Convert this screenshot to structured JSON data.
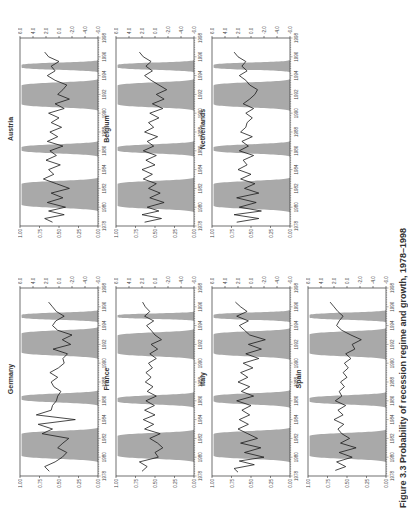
{
  "figure": {
    "rotation_deg": -90,
    "caption": "Figure 3.3 Probability of recession regime and growth, 1978–1998",
    "left_axis_ticks": [
      "1.00",
      "0.75",
      "0.50",
      "0.25",
      "0.00"
    ],
    "right_axis_ticks": [
      "6.0",
      "4.0",
      "2.0",
      "0.0",
      "-2.0",
      "-4.0",
      "-6.0"
    ],
    "x_ticks": [
      "1978",
      "1980",
      "1982",
      "1984",
      "1986",
      "1988",
      "1990",
      "1992",
      "1994",
      "1996",
      "1998"
    ],
    "colors": {
      "shade": "#a9a9a9",
      "line": "#1a1a1a",
      "axis": "#333333"
    }
  },
  "chart_data": [
    {
      "type": "area+line",
      "title": "Germany",
      "xlim": [
        1978,
        1998
      ],
      "ylim_left": [
        0,
        1
      ],
      "ylim_right": [
        -6,
        6
      ],
      "recession_bands": [
        [
          1979.8,
          1982.8
        ],
        [
          1985.8,
          1986.8
        ],
        [
          1990.8,
          1993.5
        ],
        [
          1994.6,
          1995.4
        ]
      ],
      "growth": [
        [
          1978.5,
          1.5
        ],
        [
          1979,
          2.2
        ],
        [
          1979.5,
          0.6
        ],
        [
          1980,
          -0.5
        ],
        [
          1980.5,
          -1.2
        ],
        [
          1981,
          0.2
        ],
        [
          1981.5,
          -0.6
        ],
        [
          1982,
          -1.5
        ],
        [
          1982.5,
          2.6
        ],
        [
          1983,
          1.0
        ],
        [
          1983.5,
          3.2
        ],
        [
          1984,
          -2.5
        ],
        [
          1984.5,
          3.5
        ],
        [
          1985,
          1.2
        ],
        [
          1985.5,
          1.0
        ],
        [
          1986,
          0.4
        ],
        [
          1986.5,
          0.2
        ],
        [
          1987,
          -0.3
        ],
        [
          1987.5,
          0.8
        ],
        [
          1988,
          1.2
        ],
        [
          1988.5,
          0.2
        ],
        [
          1989,
          1.4
        ],
        [
          1989.5,
          0.1
        ],
        [
          1990,
          -0.8
        ],
        [
          1990.5,
          -0.6
        ],
        [
          1991,
          -1.3
        ],
        [
          1991.5,
          0.9
        ],
        [
          1992,
          -1.8
        ],
        [
          1992.5,
          -0.5
        ],
        [
          1993,
          -2.0
        ],
        [
          1993.5,
          0.2
        ],
        [
          1994,
          1.0
        ],
        [
          1994.5,
          0.5
        ],
        [
          1995,
          -0.8
        ],
        [
          1995.5,
          0.4
        ],
        [
          1996,
          1.0
        ],
        [
          1996.5,
          1.6
        ]
      ]
    },
    {
      "type": "area+line",
      "title": "France",
      "xlim": [
        1978,
        1998
      ],
      "ylim_left": [
        0,
        1
      ],
      "ylim_right": [
        -6,
        6
      ],
      "recession_bands": [
        [
          1979.8,
          1982.6
        ],
        [
          1985.6,
          1986.6
        ],
        [
          1990.7,
          1993.3
        ],
        [
          1994.7,
          1995.3
        ]
      ],
      "growth": [
        [
          1978.5,
          2.0
        ],
        [
          1979,
          1.2
        ],
        [
          1979.5,
          2.4
        ],
        [
          1980,
          -0.5
        ],
        [
          1980.5,
          0.0
        ],
        [
          1981,
          -1.2
        ],
        [
          1981.5,
          -0.4
        ],
        [
          1982,
          0.8
        ],
        [
          1982.5,
          -0.8
        ],
        [
          1983,
          1.6
        ],
        [
          1983.5,
          0.2
        ],
        [
          1984,
          1.8
        ],
        [
          1984.5,
          0.0
        ],
        [
          1985,
          1.6
        ],
        [
          1985.5,
          0.1
        ],
        [
          1986,
          1.4
        ],
        [
          1986.5,
          -0.2
        ],
        [
          1987,
          1.2
        ],
        [
          1987.5,
          0.3
        ],
        [
          1988,
          1.5
        ],
        [
          1988.5,
          0.6
        ],
        [
          1989,
          1.4
        ],
        [
          1989.5,
          0.4
        ],
        [
          1990,
          1.0
        ],
        [
          1990.5,
          -0.2
        ],
        [
          1991,
          0.8
        ],
        [
          1991.5,
          -0.4
        ],
        [
          1992,
          0.6
        ],
        [
          1992.5,
          -1.0
        ],
        [
          1993,
          0.0
        ],
        [
          1993.5,
          0.6
        ],
        [
          1994,
          1.3
        ],
        [
          1994.5,
          0.2
        ],
        [
          1995,
          1.6
        ],
        [
          1995.5,
          0.8
        ],
        [
          1996,
          1.5
        ],
        [
          1996.5,
          1.9
        ]
      ]
    },
    {
      "type": "area+line",
      "title": "Italy",
      "xlim": [
        1978,
        1998
      ],
      "ylim_left": [
        0,
        1
      ],
      "ylim_right": [
        -6,
        6
      ],
      "recession_bands": [
        [
          1979.8,
          1982.8
        ],
        [
          1985.6,
          1986.8
        ],
        [
          1990.7,
          1993.4
        ],
        [
          1994.6,
          1995.4
        ]
      ],
      "growth": [
        [
          1978.4,
          2.0
        ],
        [
          1978.8,
          2.6
        ],
        [
          1979.2,
          -0.5
        ],
        [
          1979.6,
          1.8
        ],
        [
          1980,
          -2.0
        ],
        [
          1980.5,
          1.0
        ],
        [
          1981,
          -1.5
        ],
        [
          1981.5,
          1.6
        ],
        [
          1982,
          -1.0
        ],
        [
          1982.5,
          0.5
        ],
        [
          1983,
          2.0
        ],
        [
          1983.5,
          0.4
        ],
        [
          1984,
          1.8
        ],
        [
          1984.5,
          0.2
        ],
        [
          1985,
          1.4
        ],
        [
          1985.5,
          0.0
        ],
        [
          1986,
          2.2
        ],
        [
          1986.5,
          -0.4
        ],
        [
          1987,
          1.5
        ],
        [
          1987.5,
          0.2
        ],
        [
          1988,
          2.0
        ],
        [
          1988.5,
          0.5
        ],
        [
          1989,
          1.6
        ],
        [
          1989.5,
          -0.3
        ],
        [
          1990,
          1.2
        ],
        [
          1990.5,
          -1.2
        ],
        [
          1991,
          0.8
        ],
        [
          1991.5,
          -1.6
        ],
        [
          1992,
          0.4
        ],
        [
          1992.5,
          -2.2
        ],
        [
          1993,
          0.2
        ],
        [
          1993.5,
          1.0
        ],
        [
          1994,
          1.8
        ],
        [
          1994.5,
          0.4
        ],
        [
          1995,
          2.2
        ],
        [
          1995.5,
          0.6
        ],
        [
          1996,
          1.6
        ],
        [
          1996.5,
          2.4
        ]
      ]
    },
    {
      "type": "area+line",
      "title": "Spain",
      "xlim": [
        1978,
        1998
      ],
      "ylim_left": [
        0,
        1
      ],
      "ylim_right": [
        -6,
        6
      ],
      "recession_bands": [
        [
          1979.8,
          1982.6
        ],
        [
          1985.6,
          1986.6
        ],
        [
          1990.7,
          1993.4
        ],
        [
          1994.6,
          1995.4
        ]
      ],
      "growth": [
        [
          1978.6,
          1.8
        ],
        [
          1979,
          0.2
        ],
        [
          1979.5,
          1.6
        ],
        [
          1980,
          -0.8
        ],
        [
          1980.5,
          1.2
        ],
        [
          1981,
          -1.4
        ],
        [
          1981.5,
          1.0
        ],
        [
          1982,
          -0.4
        ],
        [
          1982.5,
          0.8
        ],
        [
          1983,
          1.4
        ],
        [
          1983.5,
          0.5
        ],
        [
          1984,
          2.0
        ],
        [
          1984.5,
          0.6
        ],
        [
          1985,
          1.4
        ],
        [
          1985.5,
          0.2
        ],
        [
          1986,
          1.8
        ],
        [
          1986.5,
          0.8
        ],
        [
          1987,
          1.2
        ],
        [
          1987.5,
          0.4
        ],
        [
          1988,
          1.0
        ],
        [
          1988.5,
          0.0
        ],
        [
          1989,
          0.6
        ],
        [
          1989.5,
          -0.2
        ],
        [
          1990,
          0.4
        ],
        [
          1990.5,
          -0.6
        ],
        [
          1991,
          0.2
        ],
        [
          1991.5,
          -1.2
        ],
        [
          1992,
          -0.8
        ],
        [
          1992.5,
          -2.2
        ],
        [
          1993,
          -0.6
        ],
        [
          1993.5,
          0.8
        ],
        [
          1994,
          1.6
        ],
        [
          1994.5,
          1.2
        ],
        [
          1995,
          0.6
        ],
        [
          1995.5,
          1.4
        ],
        [
          1996,
          2.0
        ],
        [
          1996.5,
          2.6
        ]
      ]
    },
    {
      "type": "area+line",
      "title": "Austria",
      "xlim": [
        1978,
        1998
      ],
      "ylim_left": [
        0,
        1
      ],
      "ylim_right": [
        -6,
        6
      ],
      "recession_bands": [
        [
          1979.9,
          1982.8
        ],
        [
          1985.7,
          1986.7
        ],
        [
          1990.6,
          1993.3
        ],
        [
          1994.6,
          1995.4
        ]
      ],
      "growth": [
        [
          1978.4,
          1.0
        ],
        [
          1978.8,
          2.2
        ],
        [
          1979.2,
          -0.8
        ],
        [
          1979.6,
          1.6
        ],
        [
          1980,
          -1.0
        ],
        [
          1980.5,
          1.8
        ],
        [
          1981,
          -0.6
        ],
        [
          1981.5,
          1.2
        ],
        [
          1982,
          -1.6
        ],
        [
          1982.5,
          0.4
        ],
        [
          1983,
          2.4
        ],
        [
          1983.5,
          0.8
        ],
        [
          1984,
          1.6
        ],
        [
          1984.5,
          -0.2
        ],
        [
          1985,
          2.0
        ],
        [
          1985.5,
          0.4
        ],
        [
          1986,
          1.4
        ],
        [
          1986.5,
          -0.6
        ],
        [
          1987,
          1.8
        ],
        [
          1987.5,
          0.2
        ],
        [
          1988,
          1.4
        ],
        [
          1988.5,
          -0.4
        ],
        [
          1989,
          1.2
        ],
        [
          1989.5,
          0.0
        ],
        [
          1990,
          1.6
        ],
        [
          1990.5,
          -0.8
        ],
        [
          1991,
          0.6
        ],
        [
          1991.5,
          -1.6
        ],
        [
          1992,
          0.2
        ],
        [
          1992.5,
          -0.6
        ],
        [
          1993,
          -1.2
        ],
        [
          1993.5,
          0.6
        ],
        [
          1994,
          1.8
        ],
        [
          1994.5,
          0.6
        ],
        [
          1995,
          1.2
        ],
        [
          1995.5,
          0.0
        ],
        [
          1996,
          1.6
        ],
        [
          1996.5,
          2.2
        ]
      ]
    },
    {
      "type": "area+line",
      "title": "Belgium",
      "xlim": [
        1978,
        1998
      ],
      "ylim_left": [
        0,
        1
      ],
      "ylim_right": [
        -6,
        6
      ],
      "recession_bands": [
        [
          1979.8,
          1982.8
        ],
        [
          1985.7,
          1986.7
        ],
        [
          1990.6,
          1993.3
        ],
        [
          1994.6,
          1995.4
        ]
      ],
      "growth": [
        [
          1978.4,
          1.6
        ],
        [
          1978.8,
          -1.0
        ],
        [
          1979.2,
          2.0
        ],
        [
          1979.6,
          -0.6
        ],
        [
          1980,
          1.2
        ],
        [
          1980.5,
          -1.4
        ],
        [
          1981,
          0.8
        ],
        [
          1981.5,
          -0.8
        ],
        [
          1982,
          1.0
        ],
        [
          1982.5,
          -0.2
        ],
        [
          1983,
          1.8
        ],
        [
          1983.5,
          0.4
        ],
        [
          1984,
          2.0
        ],
        [
          1984.5,
          0.0
        ],
        [
          1985,
          1.4
        ],
        [
          1985.5,
          -0.2
        ],
        [
          1986,
          1.8
        ],
        [
          1986.5,
          0.2
        ],
        [
          1987,
          1.2
        ],
        [
          1987.5,
          -0.4
        ],
        [
          1988,
          1.6
        ],
        [
          1988.5,
          0.2
        ],
        [
          1989,
          1.0
        ],
        [
          1989.5,
          -0.6
        ],
        [
          1990,
          0.8
        ],
        [
          1990.5,
          -1.2
        ],
        [
          1991,
          0.4
        ],
        [
          1991.5,
          -1.4
        ],
        [
          1992,
          -0.2
        ],
        [
          1992.5,
          -1.8
        ],
        [
          1993,
          -0.6
        ],
        [
          1993.5,
          0.6
        ],
        [
          1994,
          1.6
        ],
        [
          1994.5,
          0.4
        ],
        [
          1995,
          1.4
        ],
        [
          1995.5,
          0.6
        ],
        [
          1996,
          1.8
        ],
        [
          1996.5,
          2.4
        ]
      ]
    },
    {
      "type": "area+line",
      "title": "Netherlands",
      "xlim": [
        1978,
        1998
      ],
      "ylim_left": [
        0,
        1
      ],
      "ylim_right": [
        -6,
        6
      ],
      "recession_bands": [
        [
          1979.8,
          1982.8
        ],
        [
          1985.7,
          1986.7
        ],
        [
          1990.6,
          1993.3
        ],
        [
          1994.6,
          1995.4
        ]
      ],
      "growth": [
        [
          1978.4,
          2.2
        ],
        [
          1978.8,
          -1.2
        ],
        [
          1979.2,
          2.6
        ],
        [
          1979.6,
          -1.6
        ],
        [
          1980,
          1.8
        ],
        [
          1980.5,
          -0.8
        ],
        [
          1981,
          2.2
        ],
        [
          1981.5,
          -1.2
        ],
        [
          1982,
          1.0
        ],
        [
          1982.5,
          -0.6
        ],
        [
          1983,
          1.6
        ],
        [
          1983.5,
          0.0
        ],
        [
          1984,
          2.0
        ],
        [
          1984.5,
          0.6
        ],
        [
          1985,
          1.2
        ],
        [
          1985.5,
          -0.4
        ],
        [
          1986,
          1.8
        ],
        [
          1986.5,
          0.4
        ],
        [
          1987,
          1.4
        ],
        [
          1987.5,
          -0.2
        ],
        [
          1988,
          1.6
        ],
        [
          1988.5,
          0.8
        ],
        [
          1989,
          0.6
        ],
        [
          1989.5,
          -0.2
        ],
        [
          1990,
          0.8
        ],
        [
          1990.5,
          -0.4
        ],
        [
          1991,
          1.2
        ],
        [
          1991.5,
          0.2
        ],
        [
          1992,
          -0.6
        ],
        [
          1992.5,
          -1.0
        ],
        [
          1993,
          0.2
        ],
        [
          1993.5,
          0.8
        ],
        [
          1994,
          1.8
        ],
        [
          1994.5,
          0.6
        ],
        [
          1995,
          1.4
        ],
        [
          1995.5,
          0.8
        ],
        [
          1996,
          2.0
        ],
        [
          1996.5,
          2.6
        ]
      ]
    }
  ]
}
